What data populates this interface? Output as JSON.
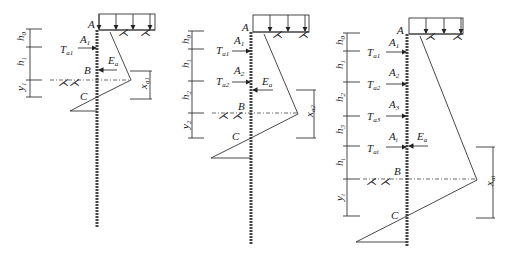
{
  "figures": [
    {
      "id": "single-anchor",
      "points": [
        "A",
        "B",
        "C"
      ],
      "dimensions": [
        {
          "base": "h",
          "sub": "0"
        },
        {
          "base": "h",
          "sub": "1"
        },
        {
          "base": "y",
          "sub": "1"
        }
      ],
      "anchors": [
        {
          "force": {
            "base": "T",
            "sub": "a1"
          },
          "point": {
            "base": "A",
            "sub": "1"
          }
        }
      ],
      "earth_pressure": {
        "base": "E",
        "sub": "a"
      },
      "distance": {
        "base": "x",
        "sub": "a1"
      }
    },
    {
      "id": "double-anchor",
      "points": [
        "A",
        "B",
        "C"
      ],
      "dimensions": [
        {
          "base": "h",
          "sub": "0"
        },
        {
          "base": "h",
          "sub": "1"
        },
        {
          "base": "h",
          "sub": "2"
        },
        {
          "base": "y",
          "sub": "2"
        }
      ],
      "anchors": [
        {
          "force": {
            "base": "T",
            "sub": "a1"
          },
          "point": {
            "base": "A",
            "sub": "1"
          }
        },
        {
          "force": {
            "base": "T",
            "sub": "a2"
          },
          "point": {
            "base": "A",
            "sub": "2"
          }
        }
      ],
      "earth_pressure": {
        "base": "E",
        "sub": "a"
      },
      "distance": {
        "base": "x",
        "sub": "a2"
      }
    },
    {
      "id": "multi-anchor",
      "points": [
        "A",
        "B",
        "C"
      ],
      "dimensions": [
        {
          "base": "h",
          "sub": "0"
        },
        {
          "base": "h",
          "sub": "1"
        },
        {
          "base": "h",
          "sub": "2"
        },
        {
          "base": "h",
          "sub": "3"
        },
        {
          "base": "h",
          "sub": "i"
        },
        {
          "base": "y",
          "sub": "i"
        }
      ],
      "anchors": [
        {
          "force": {
            "base": "T",
            "sub": "a1"
          },
          "point": {
            "base": "A",
            "sub": "1"
          }
        },
        {
          "force": {
            "base": "T",
            "sub": "a2"
          },
          "point": {
            "base": "A",
            "sub": "2"
          }
        },
        {
          "force": {
            "base": "T",
            "sub": "a3"
          },
          "point": {
            "base": "A",
            "sub": "3"
          }
        },
        {
          "force": {
            "base": "T",
            "sub": "ai"
          },
          "point": {
            "base": "A",
            "sub": "i"
          }
        }
      ],
      "earth_pressure": {
        "base": "E",
        "sub": "a"
      },
      "distance": {
        "base": "x",
        "sub": "ai"
      }
    }
  ]
}
